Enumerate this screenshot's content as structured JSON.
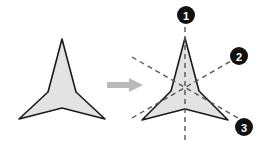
{
  "figure": {
    "background_color": "#ffffff",
    "width": 266,
    "height": 147
  },
  "shapes": {
    "fill_color": "#e3e3e3",
    "stroke_color": "#1a1a1a",
    "stroke_width": 1.6,
    "left": {
      "label": "plain-tristar",
      "description": "Concave three-pointed star without symmetry annotations",
      "points": "62,39 76,92 105,119 62,108 19,119 48,92"
    },
    "right": {
      "label": "annotated-tristar",
      "description": "Same concave three-pointed star overlaid with three mirror lines",
      "points": "185,38 199,91 228,120 185,109 142,120 171,91"
    }
  },
  "arrow": {
    "label": "transformation-arrow",
    "color": "#b9b9b9",
    "direction": "right",
    "shaft": "107,82 129,82 129,78 143,85 129,92 129,88 107,88"
  },
  "mirror_lines": {
    "style": "dashed",
    "color": "#555555",
    "dash_pattern": "5,4",
    "stroke_width": 1.4,
    "lines": [
      {
        "id": "m1",
        "name": "vertical-mirror-line",
        "x1": 185,
        "y1": 18,
        "x2": 185,
        "y2": 140
      },
      {
        "id": "m2",
        "name": "upper-right-mirror-line",
        "x1": 132,
        "y1": 118,
        "x2": 238,
        "y2": 57
      },
      {
        "id": "m3",
        "name": "lower-right-mirror-line",
        "x1": 132,
        "y1": 57,
        "x2": 238,
        "y2": 118
      }
    ]
  },
  "badges": [
    {
      "id": "badge-1",
      "name": "mirror-label-1",
      "number": "1",
      "cx": 186,
      "cy": 15,
      "r": 9
    },
    {
      "id": "badge-2",
      "name": "mirror-label-2",
      "number": "2",
      "cx": 239,
      "cy": 56,
      "r": 9
    },
    {
      "id": "badge-3",
      "name": "mirror-label-3",
      "number": "3",
      "cx": 244,
      "cy": 127,
      "r": 9
    }
  ],
  "badge_style": {
    "fill": "#111111",
    "text_color": "#ffffff"
  },
  "chart_data": {
    "type": "diagram",
    "elements": [
      {
        "name": "original-shape",
        "kind": "polygon",
        "sides": 6,
        "symmetry": "C3v"
      },
      {
        "name": "transformed-shape",
        "kind": "polygon",
        "sides": 6,
        "symmetry": "C3v"
      },
      {
        "name": "mirror-line-1",
        "orientation": "vertical",
        "angle_deg": 90
      },
      {
        "name": "mirror-line-2",
        "orientation": "diagonal",
        "angle_deg": 30
      },
      {
        "name": "mirror-line-3",
        "orientation": "diagonal",
        "angle_deg": -30
      }
    ],
    "legend": [
      "1",
      "2",
      "3"
    ]
  }
}
